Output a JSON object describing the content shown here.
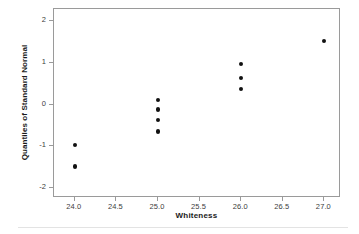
{
  "chart_data": {
    "type": "scatter",
    "title": "",
    "xlabel": "Whiteness",
    "ylabel": "Quantiles of Standard Normal",
    "xlim": [
      23.75,
      27.2
    ],
    "ylim": [
      -2.25,
      2.3
    ],
    "grid": false,
    "legend": null,
    "xticks": [
      "24.0",
      "24.5",
      "25.0",
      "25.5",
      "26.0",
      "26.5",
      "27.0"
    ],
    "xtick_values": [
      24.0,
      24.5,
      25.0,
      25.5,
      26.0,
      26.5,
      27.0
    ],
    "yticks": [
      "2",
      "1",
      "0",
      "-1",
      "-2"
    ],
    "ytick_values": [
      2,
      1,
      0,
      -1,
      -2
    ],
    "marker": {
      "shape": "circle",
      "color": "#111111",
      "size": 4.2
    },
    "points": [
      {
        "x": 24.0,
        "y": -0.97
      },
      {
        "x": 24.0,
        "y": -1.49
      },
      {
        "x": 25.0,
        "y": 0.11
      },
      {
        "x": 25.0,
        "y": -0.12
      },
      {
        "x": 25.0,
        "y": -0.38
      },
      {
        "x": 25.0,
        "y": -0.65
      },
      {
        "x": 26.0,
        "y": 0.98
      },
      {
        "x": 26.0,
        "y": 0.64
      },
      {
        "x": 26.0,
        "y": 0.38
      },
      {
        "x": 27.0,
        "y": 1.52
      }
    ],
    "colors": {
      "axis": "#9a9a9a",
      "tick_label": "#3d3d3d",
      "axis_title": "#1a1a1a",
      "background": "#ffffff",
      "rule": "#e3e3e3"
    }
  }
}
